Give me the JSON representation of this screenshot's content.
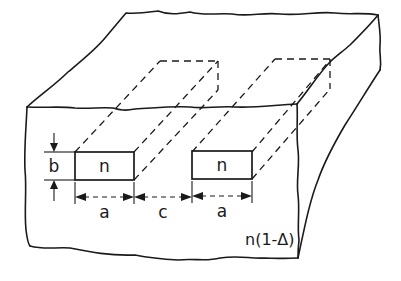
{
  "figure": {
    "labels": {
      "core_left": "n",
      "core_right": "n",
      "height": "b",
      "width_left": "a",
      "gap": "c",
      "width_right": "a",
      "cladding_index": "n(1-Δ)"
    },
    "elements": {
      "cladding_block": "substrate block with irregular broken edges",
      "guide_left": "rectangular core of width a, height b, index n",
      "guide_right": "rectangular core of width a, height b, index n",
      "hidden_edges": "dashed lines showing core extending into block"
    },
    "colors": {
      "line": "#1a1a1a",
      "background": "#ffffff"
    }
  }
}
